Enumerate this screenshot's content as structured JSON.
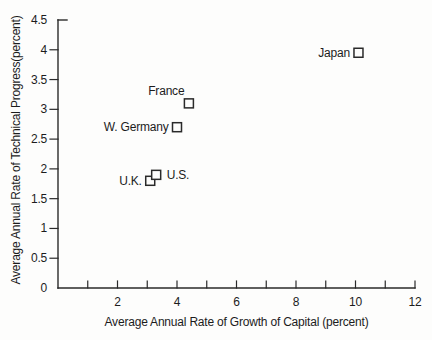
{
  "figure": {
    "background": "#fdfdfc",
    "ink": "#2a2a2a",
    "text_color": "#1c1c1c"
  },
  "chart_data": {
    "type": "scatter",
    "title": "",
    "xlabel": "Average Annual Rate of Growth of Capital (percent)",
    "ylabel": "Average Annual Rate of Technical Progress(percent)",
    "xlim": [
      0,
      12
    ],
    "ylim": [
      0,
      4.5
    ],
    "x_ticks": [
      1,
      2,
      3,
      4,
      5,
      6,
      7,
      8,
      9,
      10,
      11,
      12
    ],
    "x_tick_labels": [
      2,
      4,
      6,
      8,
      10,
      12
    ],
    "y_ticks": [
      0.5,
      1,
      1.5,
      2,
      2.5,
      3,
      3.5,
      4
    ],
    "y_tick_labels": [
      0,
      0.5,
      1,
      1.5,
      2,
      2.5,
      3,
      3.5,
      4,
      4.5
    ],
    "grid": false,
    "legend": false,
    "marker": "open-square",
    "marker_size": 9,
    "points": [
      {
        "name": "Japan",
        "x": 10.1,
        "y": 3.95,
        "label_side": "left"
      },
      {
        "name": "France",
        "x": 4.4,
        "y": 3.1,
        "label_side": "above-left"
      },
      {
        "name": "W. Germany",
        "x": 4.0,
        "y": 2.7,
        "label_side": "left"
      },
      {
        "name": "U.K.",
        "x": 3.1,
        "y": 1.8,
        "label_side": "left"
      },
      {
        "name": "U.S.",
        "x": 3.3,
        "y": 1.9,
        "label_side": "right"
      }
    ]
  }
}
